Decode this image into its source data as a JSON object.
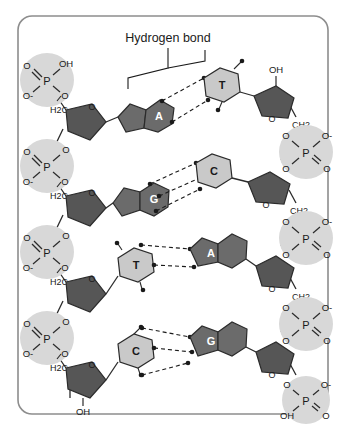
{
  "figure": {
    "annotation_label": "Hydrogen bond",
    "frame_color": "#8d8d8d",
    "background": "#ffffff"
  },
  "colors": {
    "purine_fill": "#6b6b6b",
    "pyrimidine_fill": "#c9c9c9",
    "sugar_fill": "#565656",
    "phosphate_halo": "#d8d8d8",
    "stroke": "#2b2b2b",
    "label_dark": "#1a1a1a",
    "label_light": "#ffffff"
  },
  "chemistry": {
    "sugar_ring_label": "O",
    "methylene_label": "H2C",
    "methylene_label_right": "CH2",
    "hydroxyl_label": "OH",
    "oxygen_label": "O",
    "oxygen_anion_label": "O-",
    "phosphorus_label": "P"
  },
  "base_pairs": [
    {
      "left_base": "A",
      "left_type": "purine",
      "right_base": "T",
      "right_type": "pyrimidine",
      "hbonds": 2
    },
    {
      "left_base": "G",
      "left_type": "purine",
      "right_base": "C",
      "right_type": "pyrimidine",
      "hbonds": 3
    },
    {
      "left_base": "T",
      "left_type": "pyrimidine",
      "right_base": "A",
      "right_type": "purine",
      "hbonds": 2
    },
    {
      "left_base": "C",
      "left_type": "pyrimidine",
      "right_base": "G",
      "right_type": "purine",
      "hbonds": 3
    }
  ],
  "left_strand": {
    "terminal_top_group": "OH",
    "terminal_bottom_group": "OH",
    "phosphate_labels": {
      "upper_left": "O",
      "upper_right": "OH",
      "lower_left": "O-",
      "lower_right": "O"
    },
    "phosphate_labels_internal": {
      "upper_left": "O",
      "upper_right": "O",
      "lower_left": "O-",
      "lower_right": "O"
    }
  },
  "right_strand": {
    "terminal_top_group": "OH",
    "phosphate_labels": {
      "upper_left": "O",
      "upper_right": "O-",
      "lower_left": "O",
      "lower_right": "O"
    },
    "phosphate_labels_bottom": {
      "upper_left": "O",
      "upper_right": "O-",
      "lower_left": "OH",
      "lower_right": "O"
    }
  }
}
